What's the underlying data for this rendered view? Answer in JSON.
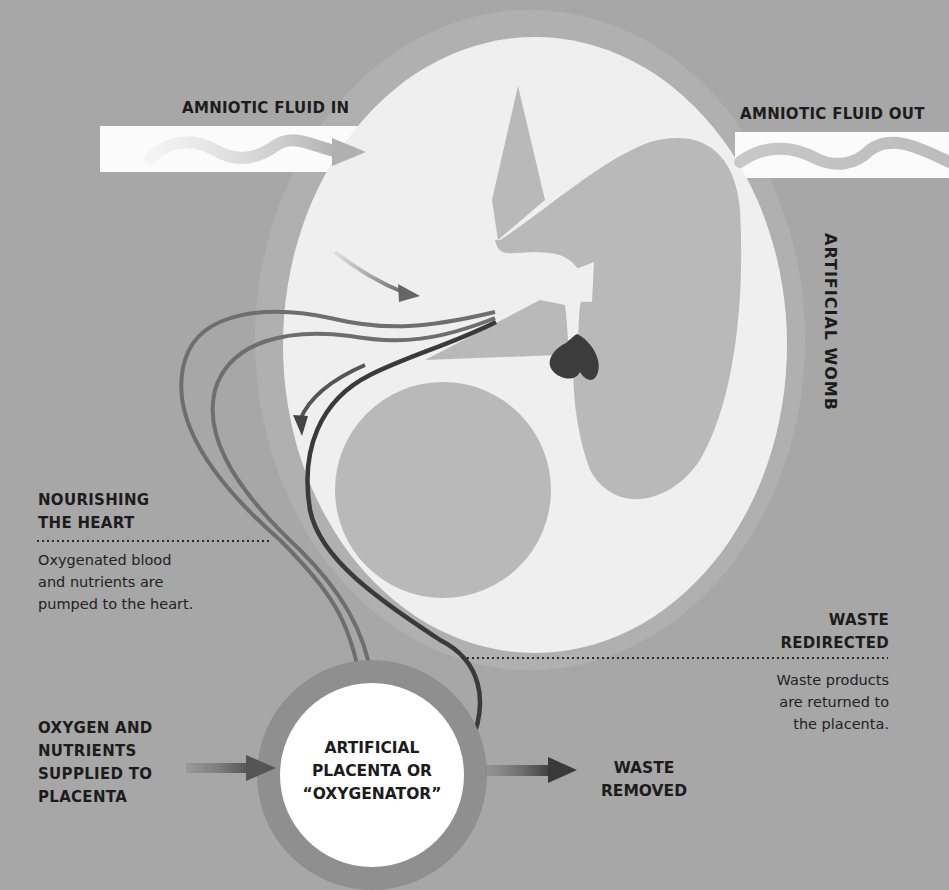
{
  "colors": {
    "background": "#a7a7a7",
    "womb": "#efefef",
    "fetus": "#b9b9b9",
    "tube_dark": "#3a3a3a",
    "tube_mid": "#6e6e6e",
    "heart": "#3c3c3c",
    "placenta_ring": "#8f8f8f",
    "placenta_core": "#ffffff",
    "text": "#1c1c1c"
  },
  "labels": {
    "fluid_in": "AMNIOTIC FLUID IN",
    "fluid_out": "AMNIOTIC FLUID OUT",
    "womb": "ARTIFICIAL WOMB",
    "nourishing_title_1": "NOURISHING",
    "nourishing_title_2": "THE HEART",
    "nourishing_body_1": "Oxygenated blood",
    "nourishing_body_2": "and nutrients are",
    "nourishing_body_3": "pumped to the heart.",
    "waste_redirected_title_1": "WASTE",
    "waste_redirected_title_2": "REDIRECTED",
    "waste_redirected_body_1": "Waste products",
    "waste_redirected_body_2": "are returned to",
    "waste_redirected_body_3": "the placenta.",
    "supply_1": "OXYGEN AND",
    "supply_2": "NUTRIENTS",
    "supply_3": "SUPPLIED TO",
    "supply_4": "PLACENTA",
    "placenta_1": "ARTIFICIAL",
    "placenta_2": "PLACENTA OR",
    "placenta_3": "“OXYGENATOR”",
    "waste_removed_1": "WASTE",
    "waste_removed_2": "REMOVED"
  },
  "icons": {
    "fluid_in_arrow": "wavy-arrow-right",
    "fluid_out_arrow": "wavy-arrow-right",
    "heart": "heart-shape",
    "supply_arrow": "arrow-right",
    "waste_arrow": "arrow-right",
    "flow_arrows": "curved-arrows"
  }
}
